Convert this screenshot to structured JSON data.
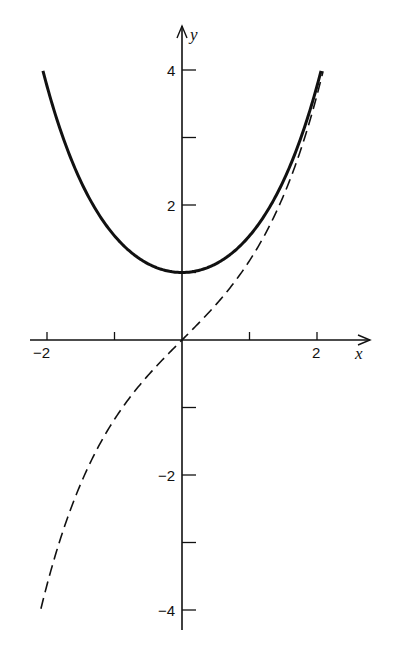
{
  "chart_data": {
    "type": "line",
    "title": "",
    "xlabel": "x",
    "ylabel": "y",
    "xlim": [
      -2.2,
      2.8
    ],
    "ylim": [
      -4.2,
      4.6
    ],
    "grid": false,
    "legend": null,
    "x_ticks": [
      -2,
      -1,
      1,
      2
    ],
    "x_tick_labels": [
      {
        "value": -2,
        "label": "−2"
      },
      {
        "value": 2,
        "label": "2"
      }
    ],
    "y_ticks": [
      -4,
      -3,
      -2,
      -1,
      1,
      2,
      3,
      4
    ],
    "y_tick_labels": [
      {
        "value": 4,
        "label": "4"
      },
      {
        "value": 2,
        "label": "2"
      },
      {
        "value": -2,
        "label": "−2"
      },
      {
        "value": -4,
        "label": "−4"
      }
    ],
    "series": [
      {
        "name": "cosh x",
        "style": "solid",
        "function": "cosh",
        "x_range": [
          -2.06,
          2.06
        ],
        "x": [
          -2.06,
          -2,
          -1.5,
          -1,
          -0.5,
          0,
          0.5,
          1,
          1.5,
          2,
          2.06
        ],
        "values": [
          3.99,
          3.76,
          2.35,
          1.54,
          1.13,
          1.0,
          1.13,
          1.54,
          2.35,
          3.76,
          3.99
        ]
      },
      {
        "name": "sinh x",
        "style": "dashed",
        "function": "sinh",
        "x_range": [
          -2.09,
          2.09
        ],
        "x": [
          -2.09,
          -2,
          -1.5,
          -1,
          -0.5,
          0,
          0.5,
          1,
          1.5,
          2,
          2.09
        ],
        "values": [
          -3.98,
          -3.63,
          -2.13,
          -1.18,
          -0.52,
          0.0,
          0.52,
          1.18,
          2.13,
          3.63,
          3.98
        ]
      }
    ]
  },
  "layout": {
    "origin_px": [
      182,
      340
    ],
    "x_unit_px": 67.5,
    "y_unit_px": 67.5,
    "x_axis_px": [
      30,
      370
    ],
    "y_axis_px": [
      26,
      630
    ],
    "line_color": "#111111"
  }
}
